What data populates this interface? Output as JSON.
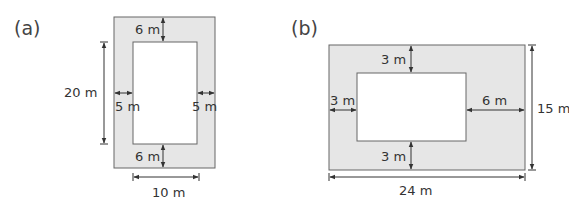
{
  "figure_a": {
    "label": "(a)",
    "outer_height": "20 m",
    "inner_width": "10 m",
    "top_border": "6 m",
    "bottom_border": "6 m",
    "left_border": "5 m",
    "right_border": "5 m"
  },
  "figure_b": {
    "label": "(b)",
    "outer_width": "24 m",
    "outer_height": "15 m",
    "top_border": "3 m",
    "bottom_border": "3 m",
    "left_border": "3 m",
    "right_border": "6 m"
  },
  "colors": {
    "shaded": "#e6e6e6",
    "stroke": "#666666"
  }
}
